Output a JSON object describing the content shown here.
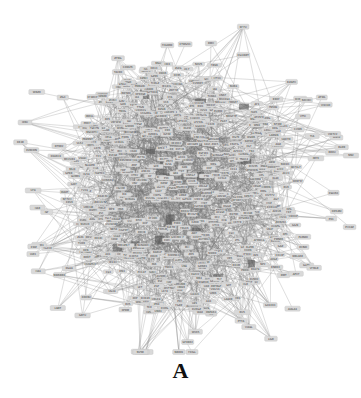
{
  "figure": {
    "panel_label": "A",
    "type": "protein-protein interaction network",
    "node_style": {
      "shape": "rounded-rectangle",
      "fill": "#d9d9d9",
      "border": "#c4c4c4",
      "label_color": "#333333"
    },
    "edge_style": {
      "color": "#8a8a8a"
    },
    "background": "#ffffff",
    "layout": {
      "center": [
        182,
        190
      ],
      "core_radius": [
        118,
        130
      ],
      "outer_radius": [
        175,
        182
      ],
      "core_nodes": 520,
      "outer_nodes": 70,
      "edges": 1400
    }
  }
}
